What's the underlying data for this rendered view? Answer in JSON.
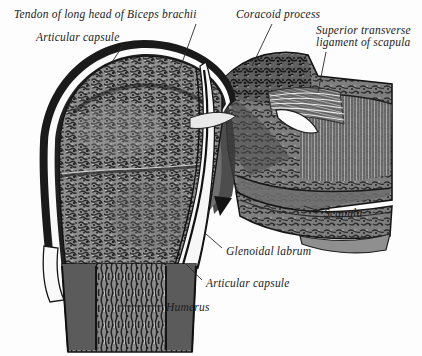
{
  "figure": {
    "background_color": "#fdfdfd",
    "ink_color": "#1b1b1b"
  },
  "labels": [
    {
      "id": "tendon-biceps",
      "text": "Tendon of long head of Biceps brachii",
      "x": 14,
      "y": 8
    },
    {
      "id": "articular-capsule-top",
      "text": "Articular capsule",
      "x": 36,
      "y": 31
    },
    {
      "id": "coracoid-process",
      "text": "Coracoid process",
      "x": 236,
      "y": 8
    },
    {
      "id": "superior-transverse-ligament-line1",
      "text": "Superior transverse",
      "x": 316,
      "y": 24
    },
    {
      "id": "superior-transverse-ligament-line2",
      "text": "ligament of scapula",
      "x": 316,
      "y": 36
    },
    {
      "id": "scapula",
      "text": "Scapula",
      "x": 324,
      "y": 207
    },
    {
      "id": "glenoidal-labrum",
      "text": "Glenoidal labrum",
      "x": 226,
      "y": 245
    },
    {
      "id": "articular-capsule-bottom",
      "text": "Articular capsule",
      "x": 206,
      "y": 277
    },
    {
      "id": "humerus",
      "text": "Humerus",
      "x": 166,
      "y": 301
    }
  ],
  "structures": [
    {
      "id": "humeral-head",
      "name": "Humeral head, cancellous bone"
    },
    {
      "id": "humeral-shaft",
      "name": "Humeral shaft with cortical walls"
    },
    {
      "id": "joint-capsule-bands",
      "name": "Layered articular capsule bands"
    },
    {
      "id": "biceps-tendon-groove",
      "name": "Long head of biceps tendon in intertubercular groove"
    },
    {
      "id": "scapula-body",
      "name": "Scapula body and neck"
    },
    {
      "id": "coracoid",
      "name": "Coracoid process"
    },
    {
      "id": "transverse-ligament-fibers",
      "name": "Fan of superior transverse ligament fibers"
    },
    {
      "id": "glenoid-labrum-shape",
      "name": "Glenoidal labrum wedge"
    }
  ]
}
